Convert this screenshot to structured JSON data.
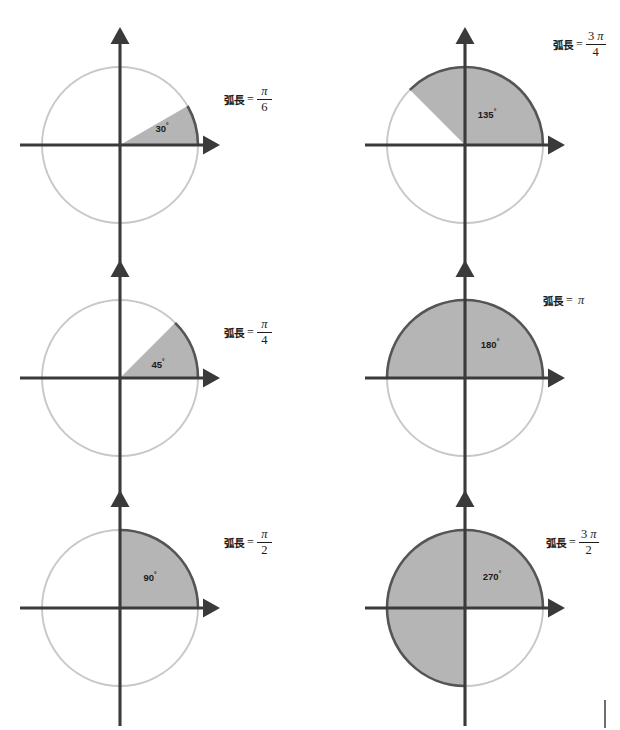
{
  "figure": {
    "title_text": "",
    "colors": {
      "sector_fill": "#b5b5b5",
      "highlight_arc": "#555555",
      "faint_circle": "#c8c8c8",
      "axis": "#3a3a3a",
      "text": "#1c1c1c",
      "background": "#ffffff",
      "corner_tick": "#6e6e6e"
    },
    "geometry": {
      "radius": 78,
      "col_centers_x": [
        120,
        465
      ],
      "row_centers_y": [
        145,
        378,
        608
      ],
      "axis_half_x": 100,
      "axis_half_y": 118
    },
    "corner_tick": {
      "x": 604,
      "y": 700,
      "height": 28
    }
  },
  "panels": [
    {
      "id": "panel-30",
      "angle_deg": 30,
      "angle_label": "30",
      "degree_symbol": "°",
      "arc_label_lead": "弧長",
      "arc_label_eq": "=",
      "arc_value_type": "fraction",
      "numerator_coefficient": "",
      "numerator_pi": "π",
      "denominator": "6",
      "arc_length_text": "π/6",
      "col": 0,
      "row": 0,
      "label_x": 224,
      "label_y": 85,
      "deg_text_x": 42,
      "deg_text_y": -13
    },
    {
      "id": "panel-135",
      "angle_deg": 135,
      "angle_label": "135",
      "degree_symbol": "°",
      "arc_label_lead": "弧長",
      "arc_label_eq": "=",
      "arc_value_type": "fraction",
      "numerator_coefficient": "3",
      "numerator_pi": "π",
      "denominator": "4",
      "arc_length_text": "3π/4",
      "col": 1,
      "row": 0,
      "label_x": 553,
      "label_y": 30,
      "deg_text_x": 22,
      "deg_text_y": -27
    },
    {
      "id": "panel-45",
      "angle_deg": 45,
      "angle_label": "45",
      "degree_symbol": "°",
      "arc_label_lead": "弧長",
      "arc_label_eq": "=",
      "arc_value_type": "fraction",
      "numerator_coefficient": "",
      "numerator_pi": "π",
      "denominator": "4",
      "arc_length_text": "π/4",
      "col": 0,
      "row": 1,
      "label_x": 224,
      "label_y": 318,
      "deg_text_x": 38,
      "deg_text_y": -10
    },
    {
      "id": "panel-180",
      "angle_deg": 180,
      "angle_label": "180",
      "degree_symbol": "°",
      "arc_label_lead": "弧長",
      "arc_label_eq": "=",
      "arc_value_type": "plain",
      "numerator_coefficient": "",
      "numerator_pi": "π",
      "denominator": "",
      "arc_length_text": "π",
      "col": 1,
      "row": 1,
      "label_x": 543,
      "label_y": 293,
      "deg_text_x": 25,
      "deg_text_y": -30
    },
    {
      "id": "panel-90",
      "angle_deg": 90,
      "angle_label": "90",
      "degree_symbol": "°",
      "arc_label_lead": "弧長",
      "arc_label_eq": "=",
      "arc_value_type": "fraction",
      "numerator_coefficient": "",
      "numerator_pi": "π",
      "denominator": "2",
      "arc_length_text": "π/2",
      "col": 0,
      "row": 2,
      "label_x": 224,
      "label_y": 528,
      "deg_text_x": 30,
      "deg_text_y": -27
    },
    {
      "id": "panel-270",
      "angle_deg": 270,
      "angle_label": "270",
      "degree_symbol": "°",
      "arc_label_lead": "弧長",
      "arc_label_eq": "=",
      "arc_value_type": "fraction",
      "numerator_coefficient": "3",
      "numerator_pi": "π",
      "denominator": "2",
      "arc_length_text": "3π/2",
      "col": 1,
      "row": 2,
      "label_x": 546,
      "label_y": 528,
      "deg_text_x": 27,
      "deg_text_y": -28
    }
  ],
  "chart_data": {
    "type": "diagram",
    "subtype": "unit-circle-radian-sector-grid",
    "title": "",
    "description_axis_x": "",
    "description_axis_y": "",
    "grid_rows": 3,
    "grid_cols": 2,
    "radius_units": 1,
    "categories": [
      "30°",
      "135°",
      "45°",
      "180°",
      "90°",
      "270°"
    ],
    "values": [
      30,
      135,
      45,
      180,
      90,
      270
    ],
    "arc_lengths": [
      "π/6",
      "3π/4",
      "π/4",
      "π",
      "π/2",
      "3π/2"
    ],
    "arc_length_numeric": [
      0.5236,
      2.3562,
      0.7854,
      3.1416,
      1.5708,
      4.7124
    ],
    "series": [
      {
        "name": "angle_degrees",
        "values": [
          30,
          135,
          45,
          180,
          90,
          270
        ]
      },
      {
        "name": "arc_length_radians",
        "values": [
          0.5236,
          2.3562,
          0.7854,
          3.1416,
          1.5708,
          4.7124
        ]
      }
    ],
    "legend": [],
    "annotations": [
      "弧長 = π/6",
      "弧長 = 3π/4",
      "弧長 = π/4",
      "弧長 = π",
      "弧長 = π/2",
      "弧長 = 3π/2"
    ]
  }
}
